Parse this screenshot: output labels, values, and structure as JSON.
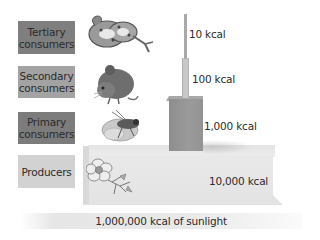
{
  "levels": [
    {
      "label": "Tertiary consumers",
      "line1": "Tertiary",
      "line2": "consumers",
      "organism": "snake",
      "energy": "10 kcal",
      "box_color": "#7f7f7f"
    },
    {
      "label": "Secondary consumers",
      "line1": "Secondary",
      "line2": "consumers",
      "organism": "mouse",
      "energy": "100 kcal",
      "box_color": "#9e9e9e"
    },
    {
      "label": "Primary consumers",
      "line1": "Primary",
      "line2": "consumers",
      "organism": "grasshopper",
      "energy": "1,000 kcal",
      "box_color": "#7a7a7a"
    },
    {
      "label": "Producers",
      "line1": "Producers",
      "line2": "",
      "organism": "flowering plant",
      "energy": "10,000 kcal",
      "box_color": "#cfcfcf"
    }
  ],
  "sunlight": "1,000,000 kcal of sunlight"
}
